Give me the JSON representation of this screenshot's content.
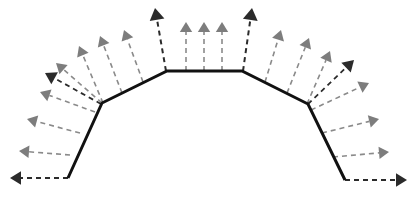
{
  "figure": {
    "width": 417,
    "height": 199,
    "background_color": "#ffffff"
  },
  "colors": {
    "profile_stroke": "#111111",
    "arrow_dark": "#2b2b2b",
    "arrow_gray": "#7d7d7d",
    "dash_dark": "#2b2b2b",
    "dash_gray": "#8a8a8a",
    "background": "#ffffff"
  },
  "profile": {
    "name": "trapezoid-profile",
    "stroke_width": 3,
    "points": [
      {
        "x": 68,
        "y": 178,
        "label": "left-end"
      },
      {
        "x": 102,
        "y": 103,
        "label": "left-knee"
      },
      {
        "x": 167,
        "y": 71,
        "label": "left-shoulder"
      },
      {
        "x": 242,
        "y": 71,
        "label": "right-shoulder"
      },
      {
        "x": 308,
        "y": 104,
        "label": "right-knee"
      },
      {
        "x": 345,
        "y": 180,
        "label": "right-end"
      }
    ]
  },
  "arrows": [
    {
      "id": "a01",
      "name": "arrow-left-base-horizontal",
      "x1": 68,
      "y1": 178,
      "x2": 10,
      "y2": 178,
      "tone": "dark",
      "head": 11,
      "width": 2.0
    },
    {
      "id": "a02",
      "name": "arrow-left-base-fan-1",
      "x1": 70,
      "y1": 155,
      "x2": 19,
      "y2": 151,
      "tone": "gray",
      "head": 10,
      "width": 1.6
    },
    {
      "id": "a03",
      "name": "arrow-left-base-fan-2",
      "x1": 80,
      "y1": 133,
      "x2": 27,
      "y2": 119,
      "tone": "gray",
      "head": 10,
      "width": 1.6
    },
    {
      "id": "a04",
      "name": "arrow-left-knee-horizontal",
      "x1": 95,
      "y1": 112,
      "x2": 40,
      "y2": 92,
      "tone": "gray",
      "head": 10,
      "width": 1.6
    },
    {
      "id": "a05",
      "name": "arrow-left-knee-fan-1",
      "x1": 101,
      "y1": 104,
      "x2": 45,
      "y2": 73,
      "tone": "dark",
      "head": 11,
      "width": 1.8
    },
    {
      "id": "a06",
      "name": "arrow-left-knee-fan-2",
      "x1": 102,
      "y1": 103,
      "x2": 56,
      "y2": 63,
      "tone": "gray",
      "head": 10,
      "width": 1.6
    },
    {
      "id": "a07",
      "name": "arrow-left-knee-fan-3",
      "x1": 103,
      "y1": 103,
      "x2": 79,
      "y2": 46,
      "tone": "gray",
      "head": 10,
      "width": 1.6
    },
    {
      "id": "a08",
      "name": "arrow-left-slope-mid",
      "x1": 122,
      "y1": 93,
      "x2": 100,
      "y2": 36,
      "tone": "gray",
      "head": 10,
      "width": 1.6
    },
    {
      "id": "a09",
      "name": "arrow-left-slope-upper",
      "x1": 143,
      "y1": 82,
      "x2": 124,
      "y2": 30,
      "tone": "gray",
      "head": 10,
      "width": 1.6
    },
    {
      "id": "a10",
      "name": "arrow-left-shoulder",
      "x1": 166,
      "y1": 71,
      "x2": 155,
      "y2": 8,
      "tone": "dark",
      "head": 12,
      "width": 2.0
    },
    {
      "id": "a11",
      "name": "arrow-top-1",
      "x1": 186,
      "y1": 71,
      "x2": 186,
      "y2": 22,
      "tone": "gray",
      "head": 10,
      "width": 1.6
    },
    {
      "id": "a12",
      "name": "arrow-top-2",
      "x1": 204,
      "y1": 71,
      "x2": 204,
      "y2": 22,
      "tone": "gray",
      "head": 10,
      "width": 1.6
    },
    {
      "id": "a13",
      "name": "arrow-top-3",
      "x1": 222,
      "y1": 71,
      "x2": 222,
      "y2": 22,
      "tone": "gray",
      "head": 10,
      "width": 1.6
    },
    {
      "id": "a14",
      "name": "arrow-right-shoulder",
      "x1": 243,
      "y1": 71,
      "x2": 252,
      "y2": 8,
      "tone": "dark",
      "head": 12,
      "width": 2.0
    },
    {
      "id": "a15",
      "name": "arrow-right-slope-upper",
      "x1": 265,
      "y1": 82,
      "x2": 281,
      "y2": 30,
      "tone": "gray",
      "head": 10,
      "width": 1.6
    },
    {
      "id": "a16",
      "name": "arrow-right-slope-mid",
      "x1": 287,
      "y1": 93,
      "x2": 309,
      "y2": 38,
      "tone": "gray",
      "head": 10,
      "width": 1.6
    },
    {
      "id": "a17",
      "name": "arrow-right-knee-fan-3",
      "x1": 307,
      "y1": 104,
      "x2": 330,
      "y2": 51,
      "tone": "gray",
      "head": 10,
      "width": 1.6
    },
    {
      "id": "a18",
      "name": "arrow-right-knee-fan-2",
      "x1": 308,
      "y1": 104,
      "x2": 354,
      "y2": 60,
      "tone": "dark",
      "head": 11,
      "width": 1.8
    },
    {
      "id": "a19",
      "name": "arrow-right-knee-fan-1",
      "x1": 311,
      "y1": 110,
      "x2": 369,
      "y2": 83,
      "tone": "gray",
      "head": 10,
      "width": 1.6
    },
    {
      "id": "a20",
      "name": "arrow-right-base-fan-2",
      "x1": 322,
      "y1": 133,
      "x2": 379,
      "y2": 119,
      "tone": "gray",
      "head": 10,
      "width": 1.6
    },
    {
      "id": "a21",
      "name": "arrow-right-base-fan-1",
      "x1": 333,
      "y1": 157,
      "x2": 389,
      "y2": 152,
      "tone": "gray",
      "head": 10,
      "width": 1.6
    },
    {
      "id": "a22",
      "name": "arrow-right-base-horizontal",
      "x1": 345,
      "y1": 180,
      "x2": 407,
      "y2": 180,
      "tone": "dark",
      "head": 11,
      "width": 2.0
    }
  ],
  "dash_pattern": "5,4"
}
